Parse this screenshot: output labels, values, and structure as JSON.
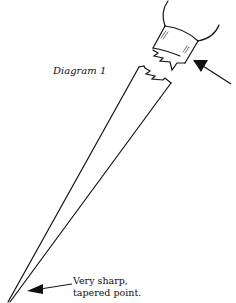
{
  "diagram": {
    "title": "Diagram 1",
    "annotation": {
      "line1": "Very sharp,",
      "line2": "tapered point."
    },
    "colors": {
      "stroke": "#111111",
      "background": "#ffffff"
    }
  }
}
